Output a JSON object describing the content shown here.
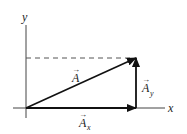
{
  "diagram": {
    "type": "vector-components",
    "axes": {
      "x_label": "x",
      "y_label": "y"
    },
    "vectors": [
      {
        "name": "A",
        "label": "A",
        "subscript": "",
        "from": [
          26,
          108
        ],
        "to": [
          136,
          58
        ]
      },
      {
        "name": "A_x",
        "label": "A",
        "subscript": "x",
        "from": [
          26,
          108
        ],
        "to": [
          136,
          108
        ]
      },
      {
        "name": "A_y",
        "label": "A",
        "subscript": "y",
        "from": [
          136,
          108
        ],
        "to": [
          136,
          58
        ]
      }
    ],
    "dashed_line": {
      "from": [
        26,
        58
      ],
      "to": [
        136,
        58
      ]
    },
    "colors": {
      "stroke": "#111111",
      "dashed": "#555555",
      "background": "#ffffff"
    },
    "arrow_symbol": "→"
  }
}
